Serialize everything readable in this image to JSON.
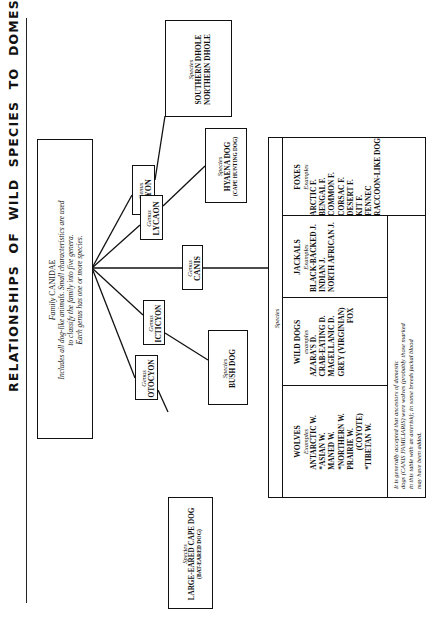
{
  "title": "RELATIONSHIPS OF WILD SPECIES TO DOMESTIC DOGS",
  "family": {
    "label": "Family",
    "name": "CANIDAE",
    "description": [
      "Includes all dog-like animals. Small characteristics are used",
      "to classify the family into five genera.",
      "Each genus has one or more species."
    ]
  },
  "genus_label": "Genus",
  "species_label": "Species",
  "genera": [
    {
      "name": "CYON",
      "species": [
        "SOUTHERN DHOLE",
        "NORTHERN DHOLE"
      ]
    },
    {
      "name": "LYCAON",
      "species": [
        "HYAENA DOG"
      ],
      "alt": "(CAPE HUNTING DOG)"
    },
    {
      "name": "CANIS"
    },
    {
      "name": "ICTICYON",
      "species": [
        "BUSH DOG"
      ]
    },
    {
      "name": "OTOCYON",
      "species": [
        "LARGE-EARED CAPE DOG"
      ],
      "alt": "(BAT-EARED DOG)"
    }
  ],
  "canis_table": {
    "header": "Species",
    "columns": [
      {
        "title": "WOLVES",
        "sub": "Examples",
        "items": [
          "ANTARCTIC W.",
          "*ASIAN W.",
          "MANED W.",
          "*NORTHERN W.",
          "PRAIRIE W.",
          "(COYOTE)",
          "*TIBETAN W."
        ]
      },
      {
        "title": "WILD DOGS",
        "sub": "examples",
        "items": [
          "AZARA'S D.",
          "CRAB-EATING D.",
          "MAGELLANIC D.",
          "GREY (VIRGINIAN)",
          "FOX"
        ]
      },
      {
        "title": "JACKALS",
        "sub": "Examples",
        "items": [
          "BLACK-BACKED J.",
          "INDIAN J.",
          "NORTH AFRICAN J."
        ]
      },
      {
        "title": "FOXES",
        "sub": "Examples",
        "items": [
          "ARCTIC F.",
          "BENGAL F.",
          "COMMON F.",
          "CORSAC F.",
          "DESERT F.",
          "KIT F.",
          "FENNEC",
          "RACCOON-LIKE DOG"
        ]
      }
    ],
    "note": [
      "It is generally accepted that ancestors of domestic",
      "dogs (CANIS FAMILIARIS) were wolves (probably those marked",
      "in this table with an asterisk); in some breeds jackal blood",
      "may have been added."
    ]
  }
}
